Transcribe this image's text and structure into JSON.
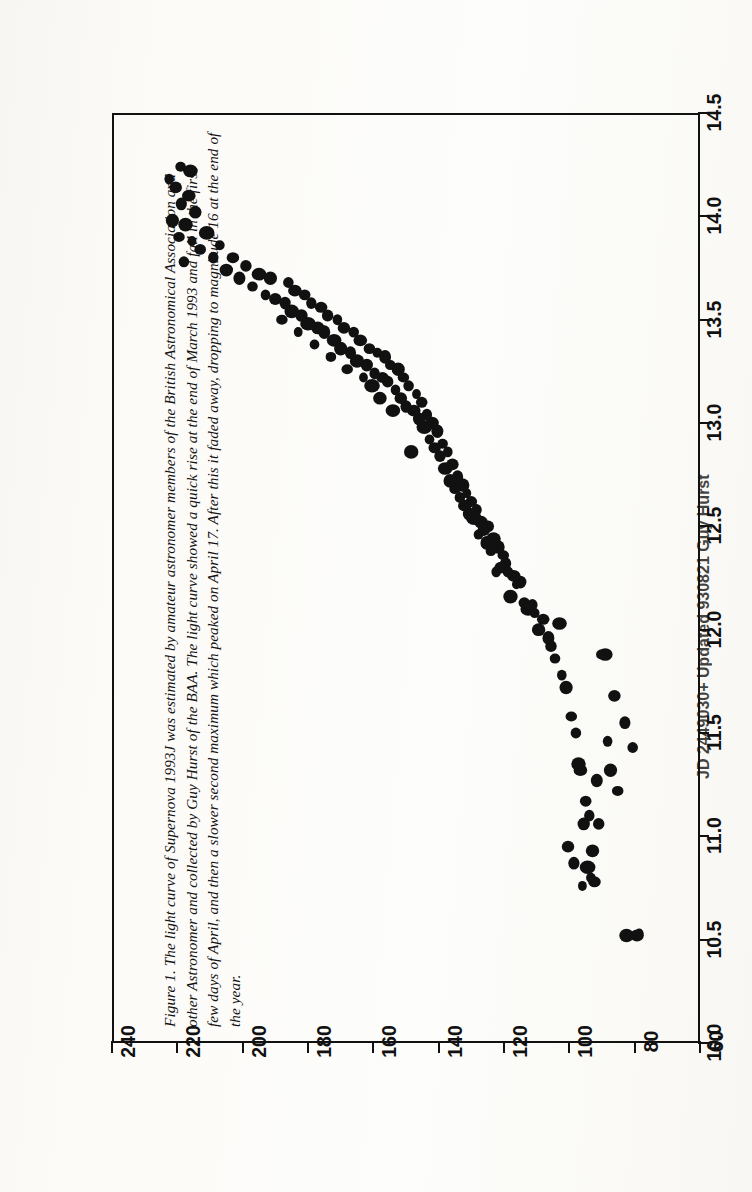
{
  "page": {
    "orientation": "rotated-90-ccw",
    "background_hex": "#fdfdfb",
    "ink_hex": "#111111"
  },
  "caption": {
    "lines": [
      "Figure 1. The light curve of Supernova 1993J was estimated by amateur astronomer members of the British Astronomical Association and",
      "other Astronomer and collected by Guy Hurst of the BAA. The light curve showed a quick rise at the end of March 1993 and fall in the first",
      "few days of April, and then a slower second maximum which peaked on April 17. After this it faded away, dropping to magnitude 16 at the end of",
      "the year."
    ]
  },
  "credit": {
    "text": "JD 2449030+  Updated 930821  Guy Hurst"
  },
  "chart_data": {
    "type": "scatter",
    "title": "",
    "xlabel": "JD 2449030+",
    "ylabel": "Magnitude",
    "xlim": [
      60,
      240
    ],
    "ylim": [
      10.0,
      14.5
    ],
    "y_inverted": true,
    "grid": false,
    "legend": null,
    "xticks": [
      60,
      80,
      100,
      120,
      140,
      160,
      180,
      200,
      220,
      240
    ],
    "xticklabels": [
      "60",
      "80",
      "100",
      "120",
      "140",
      "160",
      "180",
      "200",
      "220",
      "240"
    ],
    "yticks": [
      10.0,
      10.5,
      11.0,
      11.5,
      12.0,
      12.5,
      13.0,
      13.5,
      14.0,
      14.5
    ],
    "yticklabels": [
      "10.0",
      "10.5",
      "11.0",
      "11.5",
      "12.0",
      "12.5",
      "13.0",
      "13.5",
      "14.0",
      "14.5"
    ],
    "marker": "filled-circle",
    "marker_color": "#111111",
    "points": [
      [
        78.6,
        10.53
      ],
      [
        79.3,
        10.52
      ],
      [
        82.5,
        10.52
      ],
      [
        80.6,
        11.43
      ],
      [
        83.0,
        11.55
      ],
      [
        85.2,
        11.22
      ],
      [
        86.2,
        11.68
      ],
      [
        87.4,
        11.32
      ],
      [
        88.3,
        11.46
      ],
      [
        89.0,
        11.88
      ],
      [
        90.2,
        11.88
      ],
      [
        91.0,
        11.06
      ],
      [
        91.6,
        11.27
      ],
      [
        92.3,
        10.78
      ],
      [
        92.9,
        10.93
      ],
      [
        93.4,
        10.8
      ],
      [
        93.9,
        11.1
      ],
      [
        94.4,
        10.85
      ],
      [
        95.0,
        11.17
      ],
      [
        95.6,
        11.06
      ],
      [
        96.0,
        10.76
      ],
      [
        96.6,
        11.32
      ],
      [
        97.2,
        11.35
      ],
      [
        98.0,
        11.5
      ],
      [
        98.6,
        10.87
      ],
      [
        99.4,
        11.58
      ],
      [
        100.4,
        10.95
      ],
      [
        101.0,
        11.72
      ],
      [
        102.3,
        11.78
      ],
      [
        103.0,
        12.03
      ],
      [
        104.4,
        11.86
      ],
      [
        105.6,
        11.92
      ],
      [
        106.4,
        11.96
      ],
      [
        108.0,
        12.05
      ],
      [
        109.4,
        12.0
      ],
      [
        110.6,
        12.08
      ],
      [
        111.3,
        12.12
      ],
      [
        112.6,
        12.1
      ],
      [
        113.8,
        12.13
      ],
      [
        115.0,
        12.23
      ],
      [
        116.2,
        12.22
      ],
      [
        117.0,
        12.26
      ],
      [
        118.0,
        12.16
      ],
      [
        118.8,
        12.28
      ],
      [
        119.5,
        12.32
      ],
      [
        120.2,
        12.36
      ],
      [
        121.0,
        12.3
      ],
      [
        121.8,
        12.4
      ],
      [
        122.4,
        12.28
      ],
      [
        123.2,
        12.44
      ],
      [
        124.0,
        12.38
      ],
      [
        124.8,
        12.5
      ],
      [
        125.4,
        12.42
      ],
      [
        126.2,
        12.48
      ],
      [
        127.0,
        12.52
      ],
      [
        127.8,
        12.46
      ],
      [
        128.4,
        12.58
      ],
      [
        129.2,
        12.54
      ],
      [
        130.0,
        12.62
      ],
      [
        130.7,
        12.56
      ],
      [
        131.4,
        12.66
      ],
      [
        132.0,
        12.6
      ],
      [
        132.8,
        12.7
      ],
      [
        133.5,
        12.64
      ],
      [
        134.2,
        12.74
      ],
      [
        135.0,
        12.68
      ],
      [
        135.8,
        12.8
      ],
      [
        136.5,
        12.72
      ],
      [
        137.2,
        12.86
      ],
      [
        138.0,
        12.78
      ],
      [
        138.8,
        12.9
      ],
      [
        139.6,
        12.84
      ],
      [
        140.4,
        12.96
      ],
      [
        141.2,
        12.88
      ],
      [
        142.0,
        13.0
      ],
      [
        142.8,
        12.92
      ],
      [
        143.6,
        13.04
      ],
      [
        144.4,
        12.98
      ],
      [
        145.2,
        13.1
      ],
      [
        146.0,
        13.02
      ],
      [
        146.8,
        13.14
      ],
      [
        147.6,
        13.06
      ],
      [
        148.4,
        12.86
      ],
      [
        149.2,
        13.18
      ],
      [
        150.0,
        13.08
      ],
      [
        150.8,
        13.22
      ],
      [
        151.6,
        13.12
      ],
      [
        152.4,
        13.26
      ],
      [
        153.2,
        13.16
      ],
      [
        154.0,
        13.06
      ],
      [
        154.8,
        13.28
      ],
      [
        155.6,
        13.2
      ],
      [
        156.4,
        13.32
      ],
      [
        157.2,
        13.22
      ],
      [
        158.0,
        13.12
      ],
      [
        158.8,
        13.34
      ],
      [
        159.6,
        13.24
      ],
      [
        160.4,
        13.18
      ],
      [
        161.2,
        13.36
      ],
      [
        162.0,
        13.28
      ],
      [
        163.0,
        13.22
      ],
      [
        164.0,
        13.4
      ],
      [
        165.0,
        13.3
      ],
      [
        166.0,
        13.44
      ],
      [
        167.0,
        13.34
      ],
      [
        168.0,
        13.26
      ],
      [
        169.0,
        13.46
      ],
      [
        170.0,
        13.36
      ],
      [
        171.0,
        13.5
      ],
      [
        172.0,
        13.4
      ],
      [
        173.0,
        13.32
      ],
      [
        174.0,
        13.52
      ],
      [
        175.0,
        13.44
      ],
      [
        176.0,
        13.56
      ],
      [
        177.0,
        13.46
      ],
      [
        178.0,
        13.38
      ],
      [
        179.0,
        13.58
      ],
      [
        180.0,
        13.48
      ],
      [
        181.0,
        13.62
      ],
      [
        182.0,
        13.52
      ],
      [
        183.0,
        13.44
      ],
      [
        184.0,
        13.64
      ],
      [
        185.0,
        13.54
      ],
      [
        186.0,
        13.68
      ],
      [
        187.0,
        13.58
      ],
      [
        188.0,
        13.5
      ],
      [
        190.0,
        13.6
      ],
      [
        191.5,
        13.7
      ],
      [
        193.0,
        13.62
      ],
      [
        195.0,
        13.72
      ],
      [
        197.0,
        13.66
      ],
      [
        199.0,
        13.76
      ],
      [
        201.0,
        13.7
      ],
      [
        203.0,
        13.8
      ],
      [
        205.0,
        13.74
      ],
      [
        207.0,
        13.86
      ],
      [
        209.0,
        13.8
      ],
      [
        211.0,
        13.92
      ],
      [
        213.0,
        13.84
      ],
      [
        214.5,
        14.02
      ],
      [
        215.5,
        13.88
      ],
      [
        216.5,
        14.1
      ],
      [
        217.5,
        13.96
      ],
      [
        218.0,
        13.78
      ],
      [
        218.8,
        14.06
      ],
      [
        219.5,
        13.9
      ],
      [
        220.5,
        14.14
      ],
      [
        221.5,
        13.98
      ],
      [
        222.5,
        14.18
      ],
      [
        216.0,
        14.22
      ],
      [
        219.0,
        14.24
      ]
    ]
  }
}
